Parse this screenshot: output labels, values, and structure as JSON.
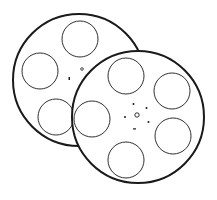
{
  "illustration": {
    "subject": "two film reels",
    "colors": {
      "stroke": "#1a1a1a",
      "fill": "#ffffff",
      "background": "#ffffff"
    },
    "back_reel": {
      "cx": 79,
      "cy": 80,
      "r": 67,
      "holes": [
        {
          "cx": 80,
          "cy": 39,
          "r": 18
        },
        {
          "cx": 40,
          "cy": 70,
          "r": 18
        },
        {
          "cx": 56,
          "cy": 116,
          "r": 18
        }
      ]
    },
    "front_reel": {
      "cx": 138,
      "cy": 116,
      "r": 67,
      "holes": [
        {
          "cx": 126,
          "cy": 75,
          "r": 18
        },
        {
          "cx": 171,
          "cy": 91,
          "r": 18
        },
        {
          "cx": 91,
          "cy": 118,
          "r": 18
        },
        {
          "cx": 173,
          "cy": 135,
          "r": 18
        },
        {
          "cx": 126,
          "cy": 160,
          "r": 18
        }
      ]
    }
  }
}
